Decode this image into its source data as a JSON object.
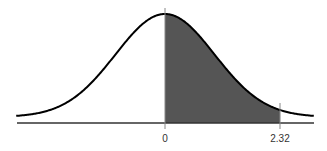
{
  "chart_data": {
    "type": "area",
    "title": "",
    "xlabel": "",
    "ylabel": "",
    "distribution": "standard normal",
    "mean": 0,
    "sd": 1,
    "xlim": [
      -3,
      3
    ],
    "tick_labels": [
      "0",
      "2.32"
    ],
    "ticks": [
      0,
      2.32
    ],
    "shaded_region": {
      "from": 0,
      "to": 2.32,
      "color": "#555555"
    },
    "curve_color": "#000000",
    "axis_color": "#333333",
    "grid": false,
    "legend": null
  },
  "labels": {
    "zero": "0",
    "z_value": "2.32"
  }
}
